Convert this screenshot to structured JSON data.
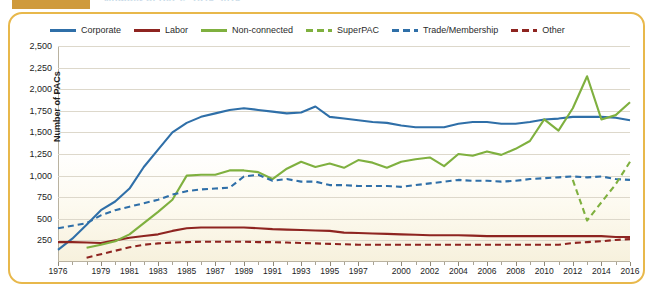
{
  "header": {
    "title_fragment": "Number of PACs, 1976-2016",
    "swatch_color": "#cf9a3c"
  },
  "legend": [
    {
      "label": "Corporate",
      "color": "#2f6fa8",
      "style": "solid"
    },
    {
      "label": "Labor",
      "color": "#8e2420",
      "style": "solid"
    },
    {
      "label": "Non-connected",
      "color": "#7fb03f",
      "style": "solid"
    },
    {
      "label": "SuperPAC",
      "color": "#7fb03f",
      "style": "dashed"
    },
    {
      "label": "Trade/Membership",
      "color": "#2f6fa8",
      "style": "dashed"
    },
    {
      "label": "Other",
      "color": "#8e2420",
      "style": "dashed"
    }
  ],
  "chart_data": {
    "type": "line",
    "title": "Number of PACs, 1976-2016",
    "xlabel": "",
    "ylabel": "Number of PACs",
    "ylim": [
      0,
      2500
    ],
    "ytick_labels": [
      "2,500",
      "2,250",
      "2,000",
      "1,750",
      "1,500",
      "1,250",
      "1,000",
      "750",
      "500",
      "250"
    ],
    "ytick_values": [
      2500,
      2250,
      2000,
      1750,
      1500,
      1250,
      1000,
      750,
      500,
      250
    ],
    "xlim": [
      1976,
      2016
    ],
    "xtick_labels": [
      "1976",
      "1979",
      "1981",
      "1983",
      "1985",
      "1987",
      "1989",
      "1991",
      "1993",
      "1995",
      "1997",
      "2000",
      "2002",
      "2004",
      "2006",
      "2008",
      "2010",
      "2012",
      "2014",
      "2016"
    ],
    "xtick_values": [
      1976,
      1979,
      1981,
      1983,
      1985,
      1987,
      1989,
      1991,
      1993,
      1995,
      1997,
      2000,
      2002,
      2004,
      2006,
      2008,
      2010,
      2012,
      2014,
      2016
    ],
    "grid": true,
    "legend_position": "top",
    "x": [
      1976,
      1977,
      1978,
      1979,
      1980,
      1981,
      1982,
      1983,
      1984,
      1985,
      1986,
      1987,
      1988,
      1989,
      1990,
      1991,
      1992,
      1993,
      1994,
      1995,
      1996,
      1997,
      1998,
      1999,
      2000,
      2001,
      2002,
      2003,
      2004,
      2005,
      2006,
      2007,
      2008,
      2009,
      2010,
      2011,
      2012,
      2013,
      2014,
      2015,
      2016
    ],
    "series": [
      {
        "name": "Corporate",
        "color": "#2f6fa8",
        "style": "solid",
        "values": [
          140,
          270,
          430,
          600,
          700,
          850,
          1100,
          1300,
          1500,
          1610,
          1680,
          1720,
          1760,
          1780,
          1760,
          1740,
          1720,
          1730,
          1800,
          1680,
          1660,
          1640,
          1620,
          1610,
          1580,
          1560,
          1560,
          1560,
          1600,
          1620,
          1620,
          1600,
          1600,
          1620,
          1650,
          1660,
          1680,
          1680,
          1680,
          1670,
          1640
        ]
      },
      {
        "name": "Labor",
        "color": "#8e2420",
        "style": "solid",
        "values": [
          230,
          230,
          225,
          220,
          250,
          280,
          300,
          320,
          360,
          390,
          400,
          400,
          400,
          400,
          390,
          380,
          375,
          370,
          365,
          360,
          340,
          335,
          330,
          325,
          320,
          315,
          310,
          310,
          310,
          305,
          300,
          300,
          300,
          300,
          300,
          300,
          300,
          300,
          300,
          290,
          290
        ]
      },
      {
        "name": "Non-connected",
        "color": "#7fb03f",
        "style": "solid",
        "values": [
          null,
          null,
          165,
          200,
          240,
          320,
          450,
          580,
          720,
          1000,
          1010,
          1010,
          1060,
          1060,
          1040,
          960,
          1080,
          1160,
          1100,
          1140,
          1090,
          1180,
          1150,
          1090,
          1160,
          1190,
          1210,
          1110,
          1250,
          1230,
          1280,
          1240,
          1310,
          1400,
          1650,
          1520,
          1780,
          2150,
          1650,
          1700,
          1850
        ]
      },
      {
        "name": "Trade/Membership",
        "color": "#2f6fa8",
        "style": "dashed",
        "values": [
          390,
          420,
          450,
          540,
          600,
          640,
          680,
          720,
          780,
          820,
          840,
          850,
          860,
          990,
          1010,
          940,
          960,
          930,
          930,
          890,
          890,
          880,
          880,
          880,
          870,
          890,
          910,
          930,
          950,
          940,
          940,
          930,
          940,
          960,
          970,
          980,
          990,
          980,
          990,
          960,
          950
        ]
      },
      {
        "name": "Other",
        "color": "#8e2420",
        "style": "dashed",
        "values": [
          null,
          null,
          50,
          90,
          130,
          170,
          200,
          215,
          225,
          230,
          235,
          235,
          235,
          235,
          230,
          230,
          225,
          220,
          215,
          210,
          205,
          200,
          200,
          200,
          200,
          200,
          200,
          200,
          200,
          200,
          200,
          200,
          200,
          200,
          200,
          200,
          220,
          230,
          240,
          255,
          265
        ]
      },
      {
        "name": "SuperPAC",
        "color": "#7fb03f",
        "style": "dashed",
        "values": [
          null,
          null,
          null,
          null,
          null,
          null,
          null,
          null,
          null,
          null,
          null,
          null,
          null,
          null,
          null,
          null,
          null,
          null,
          null,
          null,
          null,
          null,
          null,
          null,
          null,
          null,
          null,
          null,
          null,
          null,
          null,
          null,
          null,
          null,
          null,
          null,
          950,
          480,
          690,
          900,
          1160
        ]
      }
    ]
  }
}
